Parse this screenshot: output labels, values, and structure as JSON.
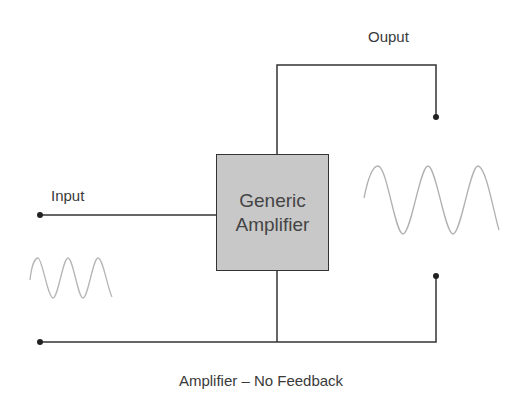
{
  "diagram": {
    "title": "Amplifier – No Feedback",
    "block": {
      "line1": "Generic",
      "line2": "Amplifier"
    },
    "labels": {
      "input": "Input",
      "output": "Ouput"
    },
    "colors": {
      "wire": "#333333",
      "box_fill": "#c8c8c8",
      "signal": "#b0b0b0",
      "text": "#3a3a3a"
    }
  }
}
